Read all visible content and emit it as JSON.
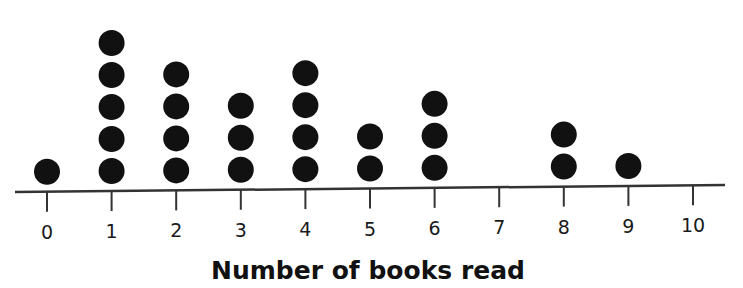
{
  "chart_data": {
    "type": "dot_plot",
    "title": "",
    "xlabel": "Number of books read",
    "ylabel": "",
    "categories": [
      "0",
      "1",
      "2",
      "3",
      "4",
      "5",
      "6",
      "7",
      "8",
      "9",
      "10"
    ],
    "values": [
      1,
      5,
      4,
      3,
      4,
      2,
      3,
      0,
      2,
      1,
      0
    ],
    "xlim": [
      0,
      10
    ],
    "grid": false,
    "legend": null,
    "total_points": 25
  },
  "style": {
    "dot_color": "#111111",
    "axis_color": "#333333"
  }
}
